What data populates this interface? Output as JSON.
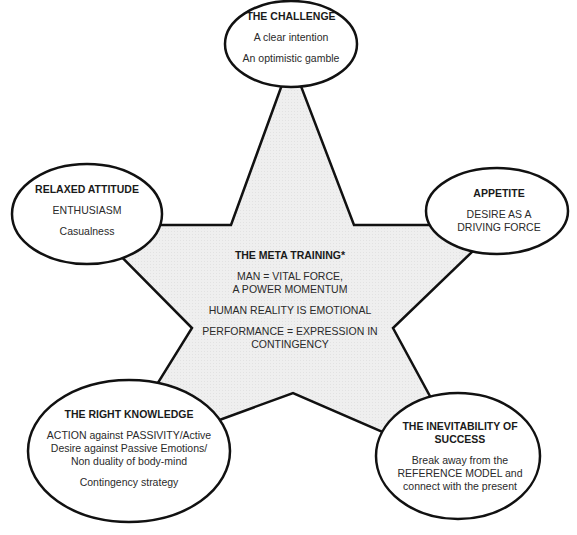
{
  "colors": {
    "star_fill": "#ececec",
    "stroke": "#111111",
    "ellipse_fill": "#ffffff",
    "text": "#2a2a2a"
  },
  "center": {
    "title": "THE META TRAINING*",
    "line1a": "MAN = VITAL FORCE,",
    "line1b": "A POWER MOMENTUM",
    "line2": "HUMAN REALITY IS EMOTIONAL",
    "line3a": "PERFORMANCE = EXPRESSION IN",
    "line3b": "CONTINGENCY"
  },
  "nodes": {
    "top": {
      "title": "THE CHALLENGE",
      "line1": "A clear intention",
      "line2": "An optimistic gamble"
    },
    "left": {
      "title": "RELAXED ATTITUDE",
      "line1": "ENTHUSIASM",
      "line2": "Casualness"
    },
    "right": {
      "title": "APPETITE",
      "line1": "DESIRE AS A",
      "line2": "DRIVING FORCE"
    },
    "bottom_left": {
      "title": "THE RIGHT KNOWLEDGE",
      "line1": "ACTION against PASSIVITY/Active",
      "line2": "Desire against Passive Emotions/",
      "line3": "Non duality of body-mind",
      "line4": "Contingency strategy"
    },
    "bottom_right": {
      "title_a": "THE INEVITABILITY OF",
      "title_b": "SUCCESS",
      "line1": "Break away from the",
      "line2": "REFERENCE MODEL and",
      "line3": "connect with the present"
    }
  }
}
